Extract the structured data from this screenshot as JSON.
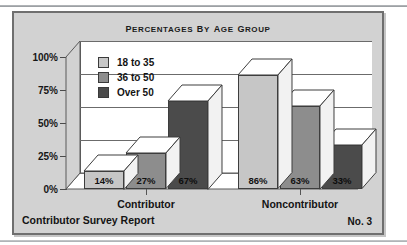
{
  "figure": {
    "title": "PERCENTAGES BY AGE GROUP",
    "footer_left": "Contributor Survey Report",
    "footer_right": "No. 3",
    "background_color": "#d2d2d2",
    "plot_background_color": "#ffffff",
    "border_color": "#6f6f6f"
  },
  "chart_data": {
    "type": "bar",
    "title": "PERCENTAGES BY AGE GROUP",
    "xlabel": "",
    "ylabel": "",
    "categories": [
      "Contributor",
      "Noncontributor"
    ],
    "series": [
      {
        "name": "18 to 35",
        "values": [
          14,
          27
        ],
        "color": "#c6c6c6"
      },
      {
        "name": "36 to 50",
        "values": [
          27,
          63
        ],
        "color": "#8d8d8d"
      },
      {
        "name": "Over 50",
        "values": [
          67,
          33
        ],
        "color": "#4b4b4b"
      }
    ],
    "series_display": [
      {
        "name": "18 to 35",
        "color": "#c6c6c6"
      },
      {
        "name": "36 to 50",
        "color": "#8d8d8d"
      },
      {
        "name": "Over 50",
        "color": "#4b4b4b"
      }
    ],
    "bars": [
      {
        "category": "Contributor",
        "series": "18 to 35",
        "value": 14,
        "label": "14%",
        "color": "#c6c6c6"
      },
      {
        "category": "Contributor",
        "series": "36 to 50",
        "value": 27,
        "label": "27%",
        "color": "#8d8d8d"
      },
      {
        "category": "Contributor",
        "series": "Over 50",
        "value": 67,
        "label": "67%",
        "color": "#4b4b4b"
      },
      {
        "category": "Noncontributor",
        "series": "18 to 35",
        "value": 86,
        "label": "86%",
        "color": "#c6c6c6"
      },
      {
        "category": "Noncontributor",
        "series": "36 to 50",
        "value": 63,
        "label": "63%",
        "color": "#8d8d8d"
      },
      {
        "category": "Noncontributor",
        "series": "Over 50",
        "value": 33,
        "label": "33%",
        "color": "#4b4b4b"
      }
    ],
    "ylim": [
      0,
      100
    ],
    "yticks": [
      0,
      25,
      50,
      75,
      100
    ],
    "ytick_labels": [
      "0%",
      "25%",
      "50%",
      "75%",
      "100%"
    ],
    "grid": true,
    "grid_axis": "y",
    "legend_position": "upper left",
    "projection": "3d-perspective",
    "data_labels": true
  }
}
